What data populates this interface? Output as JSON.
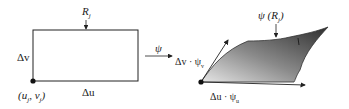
{
  "domain_view": "parametric mapping diagram",
  "left": {
    "region_label": "R",
    "region_sub": "j",
    "side_v_label": "Δv",
    "side_u_label": "Δu",
    "corner_label": "(u",
    "corner_sub1": "j",
    "corner_mid": ", v",
    "corner_sub2": "j",
    "corner_close": ")"
  },
  "map": {
    "label": "ψ"
  },
  "right": {
    "image_label_prefix": "ψ (R",
    "image_label_sub": "j",
    "image_label_suffix": ")",
    "vec_v_label": "Δv · ψ",
    "vec_v_sub": "v",
    "vec_u_label": "Δu · ψ",
    "vec_u_sub": "u"
  },
  "colors": {
    "ink": "#222222",
    "surface_dark": "#3a3a3a",
    "surface_light": "#d8d8d8"
  }
}
